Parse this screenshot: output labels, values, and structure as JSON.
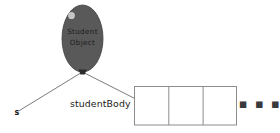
{
  "diagram": {
    "background_color": "#ffffff",
    "balloon": {
      "line1": "Student",
      "line2": "Object",
      "fill_color": "#595959",
      "edge_color": "#3d3d3d",
      "highlight_color": "#cfcfcf",
      "text_color": "#1c1c1c",
      "knot_color": "#2b2b2b"
    },
    "string_color": "#6b6b73",
    "reference_variable": {
      "label": "s"
    },
    "array": {
      "label": "studentBody",
      "border_color": "#8c8c8c",
      "cell_count": 3,
      "cells": [
        "",
        "",
        ""
      ],
      "continuation": "▪ ▪ ▪"
    }
  }
}
